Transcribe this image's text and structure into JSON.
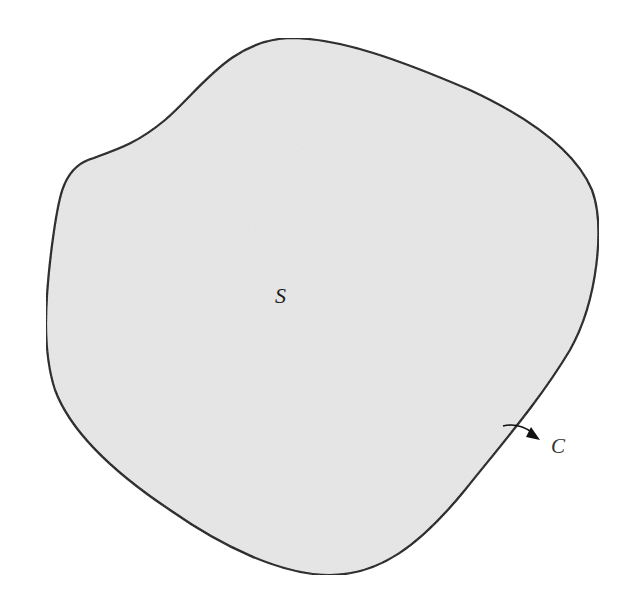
{
  "figure": {
    "region_label": "S",
    "curve_label": "C",
    "colors": {
      "region_fill": "#e6e6e6",
      "boundary_stroke": "#111111",
      "background": "#ffffff"
    }
  }
}
